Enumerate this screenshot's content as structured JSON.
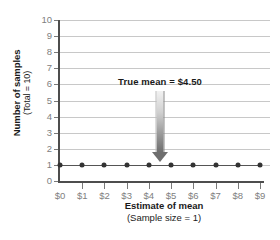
{
  "chart_data": {
    "type": "scatter",
    "title": "",
    "xlabel": "Estimate of mean",
    "xlabel_sub": "(Sample size = 1)",
    "ylabel": "Number of samples",
    "ylabel_sub": "(Total = 10)",
    "x": [
      0,
      1,
      2,
      3,
      4,
      5,
      6,
      7,
      8,
      9
    ],
    "values": [
      1,
      1,
      1,
      1,
      1,
      1,
      1,
      1,
      1,
      1
    ],
    "xtick_labels": [
      "$0",
      "$1",
      "$2",
      "$3",
      "$4",
      "$5",
      "$6",
      "$7",
      "$8",
      "$9"
    ],
    "ytick_labels": [
      "0",
      "1",
      "2",
      "3",
      "4",
      "5",
      "6",
      "7",
      "8",
      "9",
      "10"
    ],
    "yticks": [
      0,
      1,
      2,
      3,
      4,
      5,
      6,
      7,
      8,
      9,
      10
    ],
    "xlim": [
      0,
      9
    ],
    "ylim": [
      0,
      10
    ],
    "grid": true,
    "legend": "none",
    "annotations": [
      {
        "label": "True mean  =  $4.50",
        "x": 4.5,
        "y": 1,
        "marker": "down-arrow"
      }
    ],
    "colors": {
      "point": "#333333",
      "grid": "#c8c8c8",
      "axis": "#4d4d4d",
      "tick_text": "#808080",
      "label_text": "#1a1a1a",
      "arrow": "#6e6e6e"
    }
  }
}
